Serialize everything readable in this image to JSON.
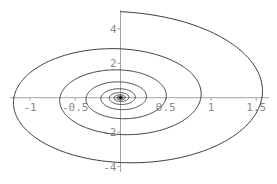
{
  "chart_data": {
    "type": "line",
    "title": "",
    "xlabel": "",
    "ylabel": "",
    "xlim": [
      -1.0,
      1.6
    ],
    "ylim": [
      -4.2,
      5.0
    ],
    "grid": false,
    "legend": null,
    "x_ticks": [
      {
        "value": -1,
        "label": "-1"
      },
      {
        "value": -0.5,
        "label": "-0.5"
      },
      {
        "value": 0.5,
        "label": "0.5"
      },
      {
        "value": 1,
        "label": "1"
      },
      {
        "value": 1.5,
        "label": "1.5"
      }
    ],
    "y_ticks": [
      {
        "value": -4,
        "label": "-4"
      },
      {
        "value": -2,
        "label": "-2"
      },
      {
        "value": 2,
        "label": "2"
      },
      {
        "value": 4,
        "label": "4"
      }
    ],
    "spiral": {
      "start": [
        0,
        5.0
      ],
      "direction": "clockwise",
      "y_amplitude": 5.0,
      "x_to_y_ratio": 0.36,
      "decay_per_radian": 0.09,
      "turns": 14
    },
    "axis_crossings": [
      {
        "x": 0,
        "y": 5.0
      },
      {
        "x": 1.56,
        "y": 0
      },
      {
        "x": 0,
        "y": -3.9
      },
      {
        "x": -1.16,
        "y": 0
      },
      {
        "x": 0,
        "y": 2.9
      },
      {
        "x": 0.86,
        "y": 0
      },
      {
        "x": 0,
        "y": -2.2
      },
      {
        "x": -0.63,
        "y": 0
      },
      {
        "x": 0,
        "y": 1.6
      },
      {
        "x": 0.47,
        "y": 0
      },
      {
        "x": 0,
        "y": -1.2
      }
    ]
  },
  "frame": {
    "origin_px": [
      120.5,
      97.7
    ],
    "px_per_x_unit": 90.5,
    "px_per_y_unit": 17.2,
    "x_axis_px": [
      10,
      269
    ],
    "y_axis_px": [
      10,
      172
    ]
  },
  "colors": {
    "curve": "#3a3a3a",
    "axis": "#9a9a9a",
    "tick_label": "#8a8a8a",
    "background": "#ffffff"
  }
}
